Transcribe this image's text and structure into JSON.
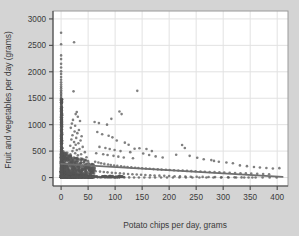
{
  "chart_data": {
    "type": "scatter",
    "title": "",
    "xlabel": "Potato chips per day, grams",
    "ylabel": "Fruit and vegetables per day (grams)",
    "xlim": [
      -15,
      420
    ],
    "ylim": [
      -160,
      3150
    ],
    "xticks": [
      0,
      50,
      100,
      150,
      200,
      250,
      300,
      350,
      400
    ],
    "xticklabels": [
      "0",
      "50",
      "100",
      "150",
      "200",
      "250",
      "300",
      "350",
      "400"
    ],
    "yticks": [
      0,
      500,
      1000,
      1500,
      2000,
      2500,
      3000
    ],
    "yticklabels": [
      "0",
      "500",
      "1000",
      "1500",
      "2000",
      "2500",
      "3000"
    ],
    "grid": true,
    "grid_color": "#e2e2e2",
    "plot_bg": "#ffffff",
    "canvas_bg": "#d4d4d4",
    "marker_color": "#555555",
    "marker_size": 1.3,
    "legend": "none",
    "fit_line": {
      "label": "linear fit",
      "color": "#6f6f6f",
      "width": 1.8,
      "x0": 0,
      "y0": 258,
      "x1": 410,
      "y1": 12
    },
    "n_points_approx": 1300,
    "points": [
      [
        0,
        2740
      ],
      [
        0,
        2520
      ],
      [
        0,
        2310
      ],
      [
        0,
        2240
      ],
      [
        0,
        2150
      ],
      [
        0,
        2080
      ],
      [
        0,
        2010
      ],
      [
        0,
        1960
      ],
      [
        0,
        1900
      ],
      [
        0,
        1850
      ],
      [
        0,
        1800
      ],
      [
        0,
        1760
      ],
      [
        0,
        1720
      ],
      [
        0,
        1690
      ],
      [
        0,
        1650
      ],
      [
        0,
        1620
      ],
      [
        0,
        1590
      ],
      [
        0,
        1560
      ],
      [
        0,
        1530
      ],
      [
        0,
        1500
      ],
      [
        0,
        1460
      ],
      [
        0,
        1420
      ],
      [
        0,
        1390
      ],
      [
        0,
        1350
      ],
      [
        0,
        1310
      ],
      [
        0,
        1280
      ],
      [
        0,
        1250
      ],
      [
        0,
        1220
      ],
      [
        0,
        1190
      ],
      [
        0,
        1160
      ],
      [
        0,
        1130
      ],
      [
        0,
        1100
      ],
      [
        0,
        1070
      ],
      [
        0,
        1040
      ],
      [
        0,
        1010
      ],
      [
        0,
        980
      ],
      [
        0,
        950
      ],
      [
        0,
        920
      ],
      [
        0,
        890
      ],
      [
        0,
        860
      ],
      [
        0,
        830
      ],
      [
        0,
        800
      ],
      [
        0,
        770
      ],
      [
        0,
        740
      ],
      [
        0,
        710
      ],
      [
        0,
        680
      ],
      [
        0,
        650
      ],
      [
        0,
        620
      ],
      [
        0,
        590
      ],
      [
        0,
        560
      ],
      [
        0,
        530
      ],
      [
        0,
        500
      ],
      [
        0,
        470
      ],
      [
        0,
        440
      ],
      [
        0,
        410
      ],
      [
        0,
        380
      ],
      [
        0,
        350
      ],
      [
        0,
        320
      ],
      [
        0,
        290
      ],
      [
        0,
        260
      ],
      [
        0,
        230
      ],
      [
        0,
        200
      ],
      [
        0,
        170
      ],
      [
        0,
        140
      ],
      [
        0,
        110
      ],
      [
        0,
        80
      ],
      [
        0,
        50
      ],
      [
        0,
        20
      ],
      [
        0,
        0
      ],
      [
        2,
        1480
      ],
      [
        2,
        1180
      ],
      [
        2,
        960
      ],
      [
        2,
        820
      ],
      [
        2,
        690
      ],
      [
        2,
        560
      ],
      [
        2,
        470
      ],
      [
        2,
        380
      ],
      [
        2,
        300
      ],
      [
        2,
        240
      ],
      [
        2,
        180
      ],
      [
        2,
        130
      ],
      [
        2,
        90
      ],
      [
        2,
        50
      ],
      [
        2,
        15
      ],
      [
        24,
        2560
      ],
      [
        23,
        1630
      ],
      [
        29,
        1240
      ],
      [
        27,
        1200
      ],
      [
        31,
        1150
      ],
      [
        22,
        1090
      ],
      [
        35,
        1070
      ],
      [
        20,
        1020
      ],
      [
        26,
        980
      ],
      [
        18,
        940
      ],
      [
        33,
        900
      ],
      [
        25,
        870
      ],
      [
        30,
        840
      ],
      [
        21,
        800
      ],
      [
        38,
        780
      ],
      [
        28,
        750
      ],
      [
        19,
        720
      ],
      [
        36,
        700
      ],
      [
        24,
        670
      ],
      [
        32,
        650
      ],
      [
        27,
        620
      ],
      [
        17,
        600
      ],
      [
        40,
        580
      ],
      [
        23,
        560
      ],
      [
        34,
        540
      ],
      [
        29,
        520
      ],
      [
        21,
        500
      ],
      [
        44,
        480
      ],
      [
        26,
        460
      ],
      [
        37,
        440
      ],
      [
        31,
        420
      ],
      [
        18,
        400
      ],
      [
        47,
        385
      ],
      [
        28,
        370
      ],
      [
        39,
        355
      ],
      [
        33,
        340
      ],
      [
        22,
        325
      ],
      [
        50,
        310
      ],
      [
        30,
        300
      ],
      [
        42,
        290
      ],
      [
        25,
        280
      ],
      [
        36,
        270
      ],
      [
        19,
        260
      ],
      [
        53,
        250
      ],
      [
        27,
        245
      ],
      [
        45,
        235
      ],
      [
        32,
        228
      ],
      [
        23,
        220
      ],
      [
        48,
        212
      ],
      [
        29,
        205
      ],
      [
        38,
        198
      ],
      [
        21,
        192
      ],
      [
        56,
        185
      ],
      [
        34,
        180
      ],
      [
        26,
        175
      ],
      [
        43,
        168
      ],
      [
        31,
        162
      ],
      [
        20,
        158
      ],
      [
        51,
        152
      ],
      [
        28,
        148
      ],
      [
        40,
        143
      ],
      [
        24,
        138
      ],
      [
        46,
        132
      ],
      [
        33,
        128
      ],
      [
        22,
        124
      ],
      [
        58,
        118
      ],
      [
        30,
        114
      ],
      [
        37,
        110
      ],
      [
        25,
        106
      ],
      [
        49,
        102
      ],
      [
        35,
        98
      ],
      [
        27,
        94
      ],
      [
        60,
        90
      ],
      [
        31,
        86
      ],
      [
        41,
        82
      ],
      [
        23,
        78
      ],
      [
        53,
        74
      ],
      [
        29,
        70
      ],
      [
        38,
        66
      ],
      [
        26,
        62
      ],
      [
        44,
        58
      ],
      [
        32,
        54
      ],
      [
        21,
        50
      ],
      [
        56,
        46
      ],
      [
        34,
        42
      ],
      [
        28,
        38
      ],
      [
        47,
        34
      ],
      [
        36,
        30
      ],
      [
        24,
        26
      ],
      [
        51,
        22
      ],
      [
        30,
        18
      ],
      [
        40,
        14
      ],
      [
        26,
        10
      ],
      [
        58,
        8
      ],
      [
        33,
        6
      ],
      [
        22,
        4
      ],
      [
        45,
        3
      ],
      [
        37,
        2
      ],
      [
        29,
        1
      ],
      [
        62,
        1050
      ],
      [
        70,
        1030
      ],
      [
        85,
        1000
      ],
      [
        93,
        1110
      ],
      [
        108,
        1250
      ],
      [
        112,
        1200
      ],
      [
        141,
        1640
      ],
      [
        67,
        860
      ],
      [
        76,
        820
      ],
      [
        88,
        790
      ],
      [
        95,
        760
      ],
      [
        103,
        700
      ],
      [
        118,
        660
      ],
      [
        125,
        620
      ],
      [
        71,
        580
      ],
      [
        82,
        560
      ],
      [
        90,
        540
      ],
      [
        99,
        520
      ],
      [
        110,
        500
      ],
      [
        128,
        480
      ],
      [
        136,
        545
      ],
      [
        65,
        460
      ],
      [
        78,
        440
      ],
      [
        86,
        425
      ],
      [
        97,
        410
      ],
      [
        106,
        395
      ],
      [
        116,
        380
      ],
      [
        133,
        365
      ],
      [
        145,
        555
      ],
      [
        158,
        540
      ],
      [
        168,
        500
      ],
      [
        152,
        455
      ],
      [
        163,
        425
      ],
      [
        175,
        400
      ],
      [
        188,
        380
      ],
      [
        224,
        615
      ],
      [
        229,
        560
      ],
      [
        213,
        430
      ],
      [
        238,
        410
      ],
      [
        252,
        375
      ],
      [
        264,
        345
      ],
      [
        278,
        330
      ],
      [
        283,
        315
      ],
      [
        292,
        300
      ],
      [
        306,
        285
      ],
      [
        318,
        270
      ],
      [
        331,
        230
      ],
      [
        344,
        215
      ],
      [
        357,
        200
      ],
      [
        368,
        190
      ],
      [
        380,
        180
      ],
      [
        392,
        172
      ],
      [
        404,
        178
      ],
      [
        63,
        300
      ],
      [
        69,
        285
      ],
      [
        74,
        270
      ],
      [
        80,
        258
      ],
      [
        87,
        248
      ],
      [
        92,
        238
      ],
      [
        98,
        228
      ],
      [
        104,
        220
      ],
      [
        111,
        212
      ],
      [
        117,
        205
      ],
      [
        123,
        198
      ],
      [
        130,
        192
      ],
      [
        137,
        186
      ],
      [
        143,
        180
      ],
      [
        150,
        175
      ],
      [
        157,
        170
      ],
      [
        164,
        165
      ],
      [
        171,
        160
      ],
      [
        179,
        155
      ],
      [
        186,
        150
      ],
      [
        194,
        146
      ],
      [
        201,
        142
      ],
      [
        209,
        138
      ],
      [
        217,
        134
      ],
      [
        225,
        130
      ],
      [
        233,
        126
      ],
      [
        241,
        122
      ],
      [
        249,
        118
      ],
      [
        258,
        114
      ],
      [
        266,
        110
      ],
      [
        275,
        106
      ],
      [
        284,
        102
      ],
      [
        293,
        98
      ],
      [
        302,
        94
      ],
      [
        312,
        90
      ],
      [
        322,
        86
      ],
      [
        332,
        82
      ],
      [
        342,
        78
      ],
      [
        352,
        74
      ],
      [
        363,
        70
      ],
      [
        374,
        66
      ],
      [
        385,
        62
      ],
      [
        64,
        120
      ],
      [
        72,
        112
      ],
      [
        79,
        105
      ],
      [
        86,
        98
      ],
      [
        94,
        92
      ],
      [
        101,
        86
      ],
      [
        109,
        80
      ],
      [
        116,
        74
      ],
      [
        124,
        68
      ],
      [
        132,
        62
      ],
      [
        140,
        57
      ],
      [
        148,
        52
      ],
      [
        156,
        48
      ],
      [
        165,
        44
      ],
      [
        173,
        40
      ],
      [
        182,
        36
      ],
      [
        191,
        32
      ],
      [
        200,
        28
      ],
      [
        210,
        25
      ],
      [
        220,
        22
      ],
      [
        230,
        19
      ],
      [
        240,
        16
      ],
      [
        251,
        14
      ],
      [
        262,
        12
      ],
      [
        273,
        10
      ],
      [
        285,
        8
      ],
      [
        297,
        6
      ],
      [
        309,
        5
      ],
      [
        321,
        4
      ],
      [
        334,
        3
      ],
      [
        347,
        2
      ],
      [
        360,
        2
      ],
      [
        373,
        1
      ],
      [
        386,
        1
      ],
      [
        399,
        1
      ],
      [
        61,
        10
      ],
      [
        68,
        8
      ],
      [
        75,
        7
      ],
      [
        83,
        6
      ],
      [
        91,
        5
      ],
      [
        100,
        4
      ],
      [
        108,
        4
      ],
      [
        117,
        3
      ],
      [
        126,
        3
      ],
      [
        135,
        2
      ],
      [
        144,
        2
      ],
      [
        154,
        2
      ],
      [
        164,
        1
      ],
      [
        174,
        1
      ],
      [
        185,
        1
      ],
      [
        196,
        1
      ],
      [
        207,
        1
      ],
      [
        219,
        0
      ],
      [
        231,
        0
      ],
      [
        243,
        0
      ],
      [
        256,
        0
      ],
      [
        269,
        0
      ],
      [
        282,
        0
      ],
      [
        296,
        0
      ],
      [
        310,
        0
      ],
      [
        324,
        0
      ],
      [
        339,
        0
      ],
      [
        354,
        0
      ]
    ]
  }
}
